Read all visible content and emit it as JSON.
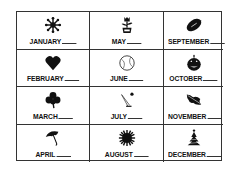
{
  "worksheet": {
    "months": [
      {
        "label": "JANUARY",
        "icon": "snowflake-icon"
      },
      {
        "label": "MAY",
        "icon": "flower-pot-icon"
      },
      {
        "label": "SEPTEMBER",
        "icon": "football-icon"
      },
      {
        "label": "FEBRUARY",
        "icon": "heart-icon"
      },
      {
        "label": "JUNE",
        "icon": "baseball-icon"
      },
      {
        "label": "OCTOBER",
        "icon": "jack-o-lantern-icon"
      },
      {
        "label": "MARCH",
        "icon": "shamrock-icon"
      },
      {
        "label": "JULY",
        "icon": "firework-icon"
      },
      {
        "label": "NOVEMBER",
        "icon": "leaf-icon"
      },
      {
        "label": "APRIL",
        "icon": "umbrella-icon"
      },
      {
        "label": "AUGUST",
        "icon": "sun-icon"
      },
      {
        "label": "DECEMBER",
        "icon": "christmas-tree-icon"
      }
    ]
  }
}
